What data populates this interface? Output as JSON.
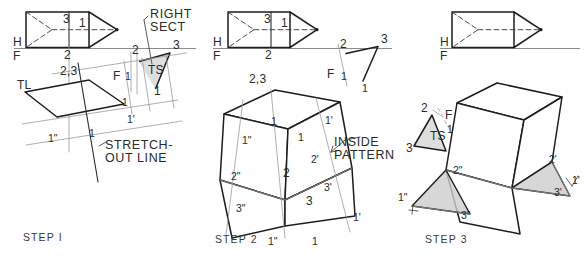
{
  "figure": {
    "background": "#ffffff",
    "ink": "#1d1d1d",
    "construction_color": "#9a9a9a",
    "shade_color": "#d8d8d8"
  },
  "steps": [
    {
      "id": "step1",
      "caption": "STEP I",
      "ref_labels": {
        "h": "H",
        "f": "F"
      },
      "callouts": [
        {
          "name": "right-sect",
          "line1": "RIGHT",
          "line2": "SECT"
        },
        {
          "name": "stretch-out-line",
          "line1": "STRETCH-",
          "line2": "OUT LINE"
        }
      ],
      "ts_label": "TS",
      "tl_label": "TL",
      "top_view_numbers": [
        "3",
        "1",
        "2"
      ],
      "aux_numbers": [
        "2",
        "3",
        "1"
      ],
      "front_numbers": [
        "2,3",
        "1"
      ],
      "stretchout_numbers": [
        "1",
        "1'",
        "1\"",
        "1"
      ],
      "f_tick": "F"
    },
    {
      "id": "step2",
      "caption": "STEP 2",
      "ref_labels": {
        "h": "H",
        "f": "F"
      },
      "callouts": [
        {
          "name": "inside-pattern",
          "line1": "INSIDE",
          "line2": "PATTERN"
        }
      ],
      "top_view_numbers": [
        "3",
        "1",
        "2"
      ],
      "aux_numbers": [
        "2",
        "3",
        "1"
      ],
      "pattern_numbers": [
        "2,3",
        "1",
        "1'",
        "1\"",
        "2'",
        "2",
        "2\"",
        "3'",
        "3",
        "3\"",
        "1",
        "1'",
        "1\""
      ],
      "f_tick": "F"
    },
    {
      "id": "step3",
      "caption": "STEP 3",
      "ref_labels": {
        "h": "H",
        "f": "F"
      },
      "ts_label": "TS",
      "ts_numbers": [
        "2",
        "3",
        "1"
      ],
      "pattern_numbers": [
        "2'",
        "1'",
        "3'",
        "2\"",
        "3\"",
        "1\""
      ],
      "f_tick": "F"
    }
  ]
}
